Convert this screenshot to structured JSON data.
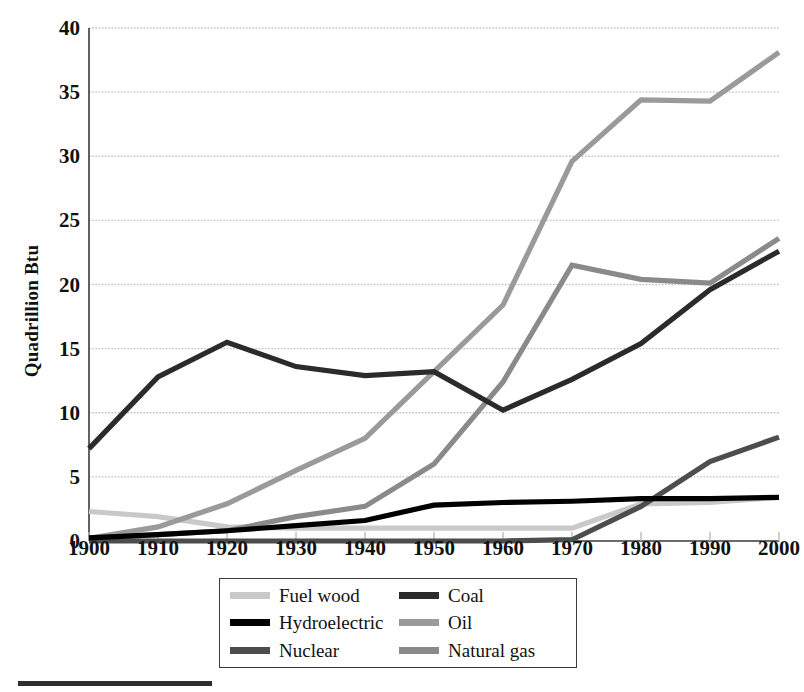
{
  "chart_data": {
    "type": "line",
    "title": "",
    "xlabel": "",
    "ylabel": "Quadrillion Btu",
    "x": [
      1900,
      1910,
      1920,
      1930,
      1940,
      1950,
      1960,
      1970,
      1980,
      1990,
      2000
    ],
    "xlim": [
      1900,
      2000
    ],
    "ylim": [
      0,
      40
    ],
    "yticks": [
      0,
      5,
      10,
      15,
      20,
      25,
      30,
      35,
      40
    ],
    "xticks": [
      "1900",
      "1910",
      "1920",
      "1930",
      "1940",
      "1950",
      "1960",
      "1970",
      "1980",
      "1990",
      "2000"
    ],
    "grid": "horizontal-dotted",
    "legend_position": "below-center",
    "series": [
      {
        "name": "Fuel wood",
        "color": "#c9c9c9",
        "values": [
          2.3,
          1.9,
          1.1,
          1.0,
          1.0,
          1.0,
          1.0,
          1.0,
          2.9,
          3.0,
          3.4
        ]
      },
      {
        "name": "Coal",
        "color": "#2b2b2b",
        "values": [
          7.2,
          12.8,
          15.5,
          13.6,
          12.9,
          13.2,
          10.2,
          12.6,
          15.4,
          19.6,
          22.6
        ]
      },
      {
        "name": "Hydroelectric",
        "color": "#000000",
        "values": [
          0.25,
          0.5,
          0.8,
          1.2,
          1.6,
          2.8,
          3.0,
          3.1,
          3.3,
          3.3,
          3.4
        ]
      },
      {
        "name": "Oil",
        "color": "#9a9a9a",
        "values": [
          0.2,
          1.1,
          2.9,
          5.5,
          8.0,
          13.2,
          18.4,
          29.6,
          34.4,
          34.3,
          38.1
        ]
      },
      {
        "name": "Nuclear",
        "color": "#4d4d4d",
        "values": [
          0.0,
          0.0,
          0.0,
          0.0,
          0.0,
          0.0,
          0.0,
          0.1,
          2.7,
          6.2,
          8.1
        ]
      },
      {
        "name": "Natural gas",
        "color": "#8a8a8a",
        "values": [
          0.2,
          0.5,
          0.8,
          1.9,
          2.7,
          6.0,
          12.4,
          21.5,
          20.4,
          20.1,
          23.6
        ]
      }
    ]
  },
  "legend": {
    "items": [
      {
        "label": "Fuel wood",
        "color": "#c9c9c9"
      },
      {
        "label": "Coal",
        "color": "#2b2b2b"
      },
      {
        "label": "Hydroelectric",
        "color": "#000000"
      },
      {
        "label": "Oil",
        "color": "#9a9a9a"
      },
      {
        "label": "Nuclear",
        "color": "#4d4d4d"
      },
      {
        "label": "Natural gas",
        "color": "#8a8a8a"
      }
    ]
  },
  "colors": {
    "axis": "#3a3a3a",
    "grid": "#c0c0c0",
    "text": "#111111",
    "background": "#ffffff"
  }
}
